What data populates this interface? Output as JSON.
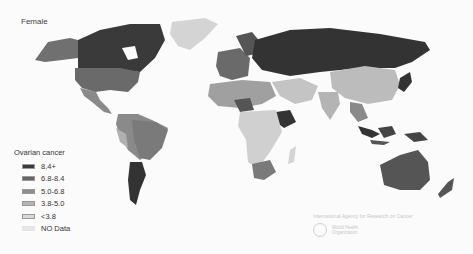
{
  "map": {
    "title": "Female",
    "legend": {
      "title": "Ovarian cancer",
      "items": [
        {
          "label": "8.4+",
          "color": "#3a3a3a"
        },
        {
          "label": "6.8-8.4",
          "color": "#666666"
        },
        {
          "label": "5.0-6.8",
          "color": "#8e8e8e"
        },
        {
          "label": "3.8-5.0",
          "color": "#b4b4b4"
        },
        {
          "label": "<3.8",
          "color": "#d8d8d8"
        },
        {
          "label": "NO Data",
          "color": "#e6e6e6"
        }
      ]
    },
    "credit": "International Agency for Research on Cancer",
    "organization": "World Health Organization"
  }
}
